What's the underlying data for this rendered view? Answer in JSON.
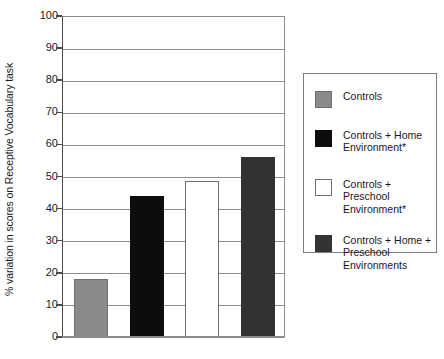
{
  "chart_data": {
    "type": "bar",
    "title": "",
    "subtitle": "",
    "xlabel": "",
    "ylabel": "% variation in scores on Receptive Vocabulary task",
    "ylim": [
      0,
      100
    ],
    "ytick_step": 10,
    "yticks": [
      "100",
      "90",
      "80",
      "70",
      "60",
      "50",
      "40",
      "30",
      "20",
      "10",
      "0"
    ],
    "categories": [
      "Controls",
      "Controls + Home Environment*",
      "Controls + Preschool Environment*",
      "Controls + Home + Preschool Environments"
    ],
    "values": [
      18,
      44,
      48.5,
      56
    ],
    "bar_colors": [
      "#8a8a8a",
      "#0d0d0d",
      "#ffffff",
      "#333333"
    ],
    "bar_edge_colors": [
      "#6f6f6f",
      "#0d0d0d",
      "#6f6f6f",
      "#333333"
    ],
    "grid": true,
    "grid_axis": "y",
    "legend_position": "right",
    "xtick_labels": []
  },
  "legend": {
    "entries": [
      {
        "label": "Controls",
        "color": "#8a8a8a",
        "edge": "#6f6f6f"
      },
      {
        "label": "Controls + Home\nEnvironment*",
        "color": "#0d0d0d",
        "edge": "#0d0d0d"
      },
      {
        "label": "Controls +\nPreschool\nEnvironment*",
        "color": "#ffffff",
        "edge": "#6f6f6f"
      },
      {
        "label": "Controls + Home +\nPreschool\nEnvironments",
        "color": "#333333",
        "edge": "#333333"
      }
    ]
  },
  "axis": {
    "y_title": "% variation in scores on Receptive Vocabulary task"
  }
}
